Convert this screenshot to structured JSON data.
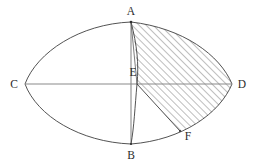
{
  "figure": {
    "type": "geometry-diagram",
    "background_color": "#ffffff",
    "stroke_color": "#404040",
    "hatch_color": "#6e6e6e",
    "label_color": "#2b2b2b",
    "points": [
      {
        "name": "A",
        "label": "A",
        "x": 131,
        "y": 22,
        "label_x": 131,
        "label_y": 15
      },
      {
        "name": "B",
        "label": "B",
        "x": 131,
        "y": 144,
        "label_x": 131,
        "label_y": 159
      },
      {
        "name": "C",
        "label": "C",
        "x": 25,
        "y": 84,
        "label_x": 14,
        "label_y": 88
      },
      {
        "name": "D",
        "label": "D",
        "x": 232,
        "y": 84,
        "label_x": 242,
        "label_y": 88
      },
      {
        "name": "E",
        "label": "E",
        "x": 137,
        "y": 84,
        "label_x": 133,
        "label_y": 76
      },
      {
        "name": "F",
        "label": "F",
        "x": 180,
        "y": 131,
        "label_x": 188,
        "label_y": 140
      }
    ],
    "segments": [
      {
        "name": "axis-CD",
        "from": "C",
        "to": "D"
      },
      {
        "name": "chord-AB",
        "from": "A",
        "to": "B"
      },
      {
        "name": "segment-EF",
        "from": "E",
        "to": "F"
      },
      {
        "name": "segment-AE",
        "from": "A",
        "to": "E"
      }
    ],
    "arcs": [
      {
        "name": "arc-C-A-D-upper",
        "from": "C",
        "through": "A",
        "to": "D"
      },
      {
        "name": "arc-C-B-D-lower",
        "from": "C",
        "through": "B",
        "to": "D"
      },
      {
        "name": "arc-A-E-B",
        "from": "A",
        "through": "E",
        "to": "B"
      }
    ],
    "shaded_region": {
      "name": "hatched-region",
      "pattern": "diagonal-hatch-45",
      "bounded_by": [
        "arc-A-D",
        "arc-D-F",
        "segment-F-E",
        "arc-E-A"
      ]
    }
  }
}
